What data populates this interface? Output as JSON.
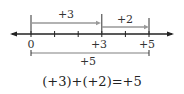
{
  "diagram": {
    "type": "number-line-addition",
    "colors": {
      "axis": "#222222",
      "arrow": "#999999",
      "text": "#333333"
    },
    "axis": {
      "tick_values": [
        0,
        1,
        2,
        3,
        4,
        5
      ],
      "labeled_ticks": [
        {
          "value": 0,
          "label": "0"
        },
        {
          "value": 3,
          "label": "+3"
        },
        {
          "value": 5,
          "label": "+5"
        }
      ]
    },
    "arrows": [
      {
        "from": 0,
        "to": 3,
        "label": "+3"
      },
      {
        "from": 3,
        "to": 5,
        "label": "+2"
      }
    ],
    "result_bracket": {
      "from": 0,
      "to": 5,
      "label": "+5"
    },
    "equation": "(+3)+(+2)=+5"
  }
}
